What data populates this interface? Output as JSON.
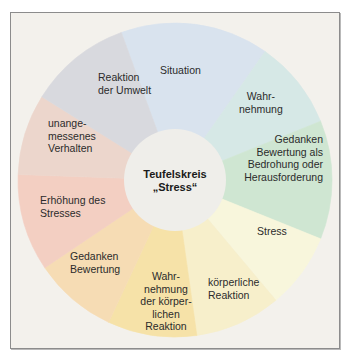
{
  "diagram": {
    "center": {
      "line1": "Teufelskreis",
      "line2": "„Stress“",
      "color": "#efeeea"
    },
    "segments": [
      {
        "id": "situation",
        "lines": [
          "Situation"
        ],
        "color": "#d9e3ee"
      },
      {
        "id": "wahrnehmung",
        "lines": [
          "Wahr-",
          "nehmung"
        ],
        "color": "#d6e8e6"
      },
      {
        "id": "gedanken-bewertung-bedrohung",
        "lines": [
          "Gedanken",
          "Bewertung als",
          "Bedrohung oder",
          "Herausforderung"
        ],
        "color": "#cfe6d2"
      },
      {
        "id": "stress",
        "lines": [
          "Stress"
        ],
        "color": "#f8f6dc"
      },
      {
        "id": "koerperliche-reaktion",
        "lines": [
          "körperliche",
          "Reaktion"
        ],
        "color": "#f7efcb"
      },
      {
        "id": "wahrnehmung-koerperlichen-reaktion",
        "lines": [
          "Wahr-",
          "nehmung",
          "der körper-",
          "lichen",
          "Reaktion"
        ],
        "color": "#f6e2a8"
      },
      {
        "id": "gedanken-bewertung",
        "lines": [
          "Gedanken",
          "Bewertung"
        ],
        "color": "#f6dcb4"
      },
      {
        "id": "erhoehung-des-stresses",
        "lines": [
          "Erhöhung des",
          "Stresses"
        ],
        "color": "#f3cfc2"
      },
      {
        "id": "unangemessenes-verhalten",
        "lines": [
          "unange-",
          "messenes",
          "Verhalten"
        ],
        "color": "#ecd6cc"
      },
      {
        "id": "reaktion-der-umwelt",
        "lines": [
          "Reaktion",
          "der Umwelt"
        ],
        "color": "#d8d9de"
      }
    ],
    "frame_background": "#f3f1ec"
  }
}
